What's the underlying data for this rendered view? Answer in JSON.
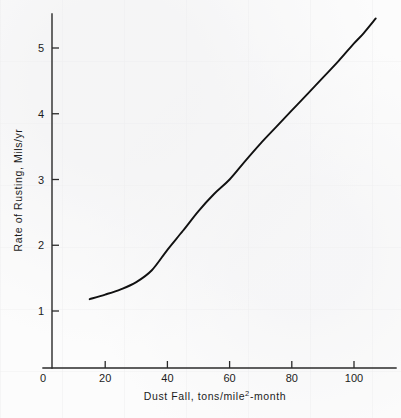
{
  "chart_data": {
    "type": "line",
    "title": "",
    "xlabel": "Dust Fall, tons/mile2-month",
    "xlabel_base": "Dust Fall, tons/mile",
    "xlabel_sup": "2",
    "xlabel_tail": "-month",
    "ylabel": "Rate of Rusting, Mils/yr",
    "xlim": [
      0,
      108
    ],
    "ylim": [
      0,
      5.6
    ],
    "xticks": [
      0,
      20,
      40,
      60,
      80,
      100
    ],
    "xtick_labels": [
      "0",
      "20",
      "40",
      "60",
      "80",
      "100"
    ],
    "yticks": [
      1,
      2,
      3,
      4,
      5
    ],
    "ytick_labels": [
      "1",
      "2",
      "3",
      "4",
      "5"
    ],
    "grid": false,
    "legend": "none",
    "series": [
      {
        "name": "Rate of Rusting vs Dust Fall",
        "color": "#111111",
        "x": [
          15,
          20,
          25,
          30,
          35,
          40,
          45,
          50,
          55,
          60,
          65,
          70,
          75,
          80,
          85,
          90,
          95,
          100,
          103,
          107
        ],
        "y": [
          1.18,
          1.25,
          1.33,
          1.44,
          1.62,
          1.93,
          2.22,
          2.52,
          2.78,
          3.0,
          3.28,
          3.55,
          3.8,
          4.05,
          4.3,
          4.55,
          4.8,
          5.07,
          5.22,
          5.45
        ]
      }
    ]
  },
  "axis": {
    "y_axis_name": "y-axis",
    "x_axis_name": "x-axis"
  }
}
